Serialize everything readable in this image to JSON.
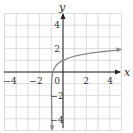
{
  "chart_data": {
    "type": "line",
    "title": "",
    "xlabel": "x",
    "ylabel": "y",
    "xlim": [
      -5,
      5
    ],
    "ylim": [
      -5,
      5
    ],
    "grid": true,
    "x_tick_labels": [
      "-4",
      "-2",
      "0",
      "2",
      "4"
    ],
    "y_tick_labels": [
      "4",
      "2",
      "-2",
      "-4"
    ],
    "asymptote": {
      "x": -1
    },
    "series": [
      {
        "name": "f(x)",
        "x": [
          -0.999,
          -0.99,
          -0.95,
          -0.9,
          -0.8,
          -0.6,
          -0.4,
          -0.2,
          0,
          0.5,
          1,
          1.5,
          2,
          2.5,
          3,
          3.5,
          4,
          4.5,
          4.8
        ],
        "y": [
          -2.45,
          -1.3,
          -0.5,
          -0.15,
          0.2,
          0.54,
          0.74,
          0.89,
          1.0,
          1.2,
          1.35,
          1.46,
          1.55,
          1.63,
          1.69,
          1.75,
          1.8,
          1.85,
          1.88
        ]
      }
    ],
    "colors": {
      "curve": "#8a8a8a",
      "axis": "#222222",
      "grid": "#d4d4d4"
    }
  },
  "labels": {
    "x_axis": "x",
    "y_axis": "y",
    "ticks_x": [
      "−4",
      "−2",
      "0",
      "2",
      "4"
    ],
    "ticks_y": [
      "4",
      "2",
      "−2",
      "−4"
    ]
  }
}
